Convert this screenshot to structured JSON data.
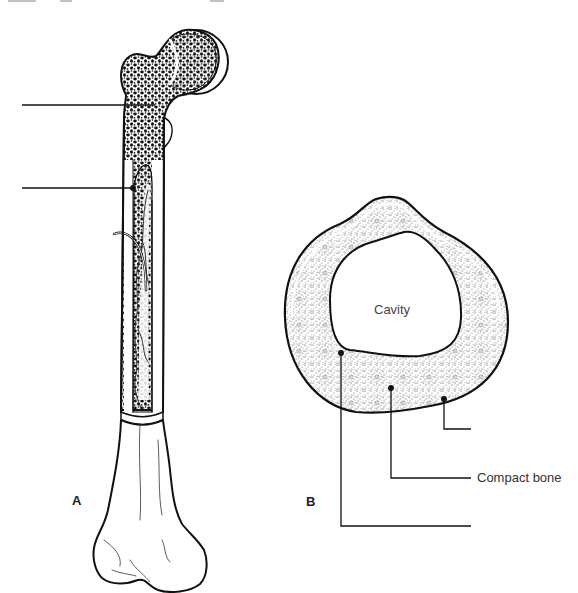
{
  "figure": {
    "panels": [
      {
        "id": "A",
        "letter": "A",
        "subject": "long bone (femur) longitudinal section"
      },
      {
        "id": "B",
        "letter": "B",
        "subject": "bone shaft cross-section"
      }
    ]
  },
  "panel_a": {
    "letter": "A",
    "labels": [
      {
        "text": "",
        "leader": "spongy-bone-region"
      },
      {
        "text": "",
        "leader": "medullary-cavity-wall"
      }
    ]
  },
  "panel_b": {
    "letter": "B",
    "cavity_label": "Cavity",
    "labels": [
      {
        "text": "",
        "leader": "periosteum"
      },
      {
        "text": "Compact bone",
        "leader": "compact-bone"
      },
      {
        "text": "",
        "leader": "endosteum"
      }
    ]
  },
  "colors": {
    "ink": "#111111",
    "stipple": "#555555",
    "background": "#ffffff"
  }
}
